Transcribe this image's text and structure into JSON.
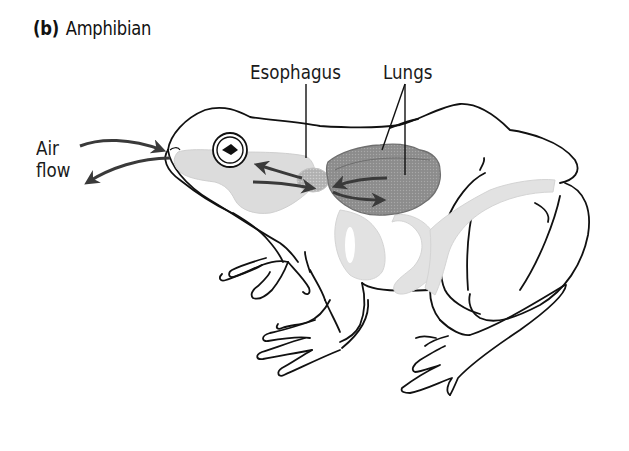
{
  "figure": {
    "panel_letter": "(b)",
    "panel_title": "Amphibian",
    "labels": {
      "esophagus": "Esophagus",
      "lungs": "Lungs",
      "air_flow_line1": "Air",
      "air_flow_line2": "flow"
    },
    "colors": {
      "outline": "#111111",
      "mouth_cavity": "#dcdcdc",
      "digestive_tract": "#e2e2e2",
      "lungs": "#8f8f8f",
      "esophagus_region": "#b3b3b3",
      "arrows": "#3a3a3a",
      "background": "#ffffff"
    },
    "arrows": [
      {
        "name": "air-in-arrow",
        "direction": "into nostril"
      },
      {
        "name": "air-out-arrow",
        "direction": "out of nostril"
      },
      {
        "name": "mouth-to-lung-arrow",
        "direction": "mouth to lungs"
      },
      {
        "name": "lung-to-mouth-arrow",
        "direction": "lungs to mouth"
      }
    ]
  }
}
